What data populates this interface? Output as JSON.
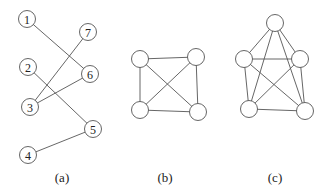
{
  "figures": [
    {
      "id": "a",
      "caption": "(a)",
      "caption_pos": [
        62,
        182
      ],
      "nodes": [
        {
          "label": "1",
          "x": 27,
          "y": 19
        },
        {
          "label": "7",
          "x": 88,
          "y": 32
        },
        {
          "label": "2",
          "x": 28,
          "y": 67
        },
        {
          "label": "6",
          "x": 90,
          "y": 74
        },
        {
          "label": "3",
          "x": 30,
          "y": 107
        },
        {
          "label": "5",
          "x": 93,
          "y": 129
        },
        {
          "label": "4",
          "x": 28,
          "y": 155
        }
      ],
      "edges": [
        [
          "1",
          "6"
        ],
        [
          "7",
          "3"
        ],
        [
          "6",
          "3"
        ],
        [
          "2",
          "5"
        ],
        [
          "4",
          "5"
        ]
      ]
    },
    {
      "id": "b",
      "caption": "(b)",
      "caption_pos": [
        165,
        182
      ],
      "nodes": [
        {
          "label": "",
          "x": 140,
          "y": 59
        },
        {
          "label": "",
          "x": 196,
          "y": 57
        },
        {
          "label": "",
          "x": 140,
          "y": 110
        },
        {
          "label": "",
          "x": 198,
          "y": 112
        }
      ],
      "edges": [
        [
          0,
          1
        ],
        [
          0,
          2
        ],
        [
          1,
          3
        ],
        [
          2,
          3
        ],
        [
          0,
          3
        ],
        [
          1,
          2
        ]
      ]
    },
    {
      "id": "c",
      "caption": "(c)",
      "caption_pos": [
        275,
        182
      ],
      "nodes": [
        {
          "label": "",
          "x": 275,
          "y": 23
        },
        {
          "label": "",
          "x": 244,
          "y": 59
        },
        {
          "label": "",
          "x": 300,
          "y": 59
        },
        {
          "label": "",
          "x": 249,
          "y": 109
        },
        {
          "label": "",
          "x": 305,
          "y": 111
        }
      ],
      "edges": [
        [
          0,
          1
        ],
        [
          0,
          2
        ],
        [
          0,
          3
        ],
        [
          0,
          4
        ],
        [
          1,
          2
        ],
        [
          1,
          3
        ],
        [
          1,
          4
        ],
        [
          2,
          3
        ],
        [
          2,
          4
        ],
        [
          3,
          4
        ]
      ]
    }
  ],
  "style": {
    "node_radius": 8.5,
    "stroke": "#555555"
  }
}
